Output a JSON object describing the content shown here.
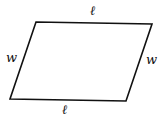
{
  "diagram": {
    "shape": "parallelogram",
    "vertices": {
      "top_left": [
        36,
        22
      ],
      "top_right": [
        152,
        24
      ],
      "bottom_right": [
        126,
        101
      ],
      "bottom_left": [
        10,
        99
      ]
    },
    "stroke_color": "#111111",
    "labels": {
      "top": "ℓ",
      "bottom": "ℓ",
      "left": "w",
      "right": "w"
    }
  }
}
